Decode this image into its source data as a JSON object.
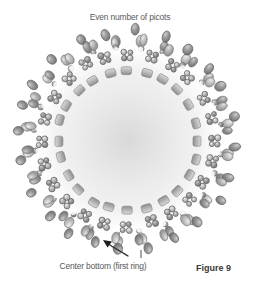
{
  "figure": {
    "caption": "Figure 9",
    "background_color": "#ffffff",
    "ink_color": "#5a5a5a"
  },
  "annotations": {
    "top_label": "Even number of picots",
    "bottom_label": "Center bottom (first ring)",
    "pointer": {
      "name": "arrow-pointer",
      "description": "curved arrow pointing up-left to the bottom of the ring"
    },
    "tick": {
      "name": "tick-mark",
      "description": "short vertical stroke above bottom label"
    }
  },
  "diagram": {
    "type": "beaded-ring",
    "center": {
      "x": 128,
      "y": 140
    },
    "radii": {
      "inner_band": 70,
      "small_bead_ring": 86,
      "picot_ring": 100,
      "outer_edge": 112
    },
    "segments": 24,
    "colors": {
      "bead_light": "#cfcfcf",
      "bead_mid": "#a8a8a8",
      "bead_dark": "#7f7f7f",
      "bead_outline": "#6e6e6e",
      "highlight": "#ededed",
      "gap": "#ffffff"
    },
    "parts": [
      {
        "name": "inner-brick-band",
        "count": 24,
        "shape": "rounded-rectangle"
      },
      {
        "name": "small-ring-bead-cluster",
        "count": 24,
        "beads_per_cluster": 4,
        "shape": "circle-outline"
      },
      {
        "name": "picot-oval-bead",
        "count": 48,
        "shape": "ellipse"
      },
      {
        "name": "outer-accent-bead",
        "count": 24,
        "shape": "ellipse-dark"
      }
    ]
  }
}
